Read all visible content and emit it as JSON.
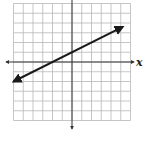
{
  "chart_data": {
    "type": "line",
    "title": "",
    "xlabel": "x",
    "ylabel": "",
    "xlim": [
      -6,
      6
    ],
    "ylim": [
      -6,
      6
    ],
    "grid": true,
    "grid_step": 1,
    "legend": null,
    "series": [
      {
        "name": "y = 1/2 x + 1",
        "equation": "y = 0.5x + 1",
        "slope": 0.5,
        "intercept": 1,
        "x": [
          -6,
          -2,
          0,
          2,
          5.2
        ],
        "y": [
          -2,
          0,
          1,
          2,
          3.6
        ],
        "arrows": "both"
      }
    ]
  },
  "labels": {
    "x_axis": "x"
  },
  "colors": {
    "grid": "#b8b8b8",
    "axis": "#333333",
    "line": "#1a1a1a",
    "background": "#ffffff"
  }
}
